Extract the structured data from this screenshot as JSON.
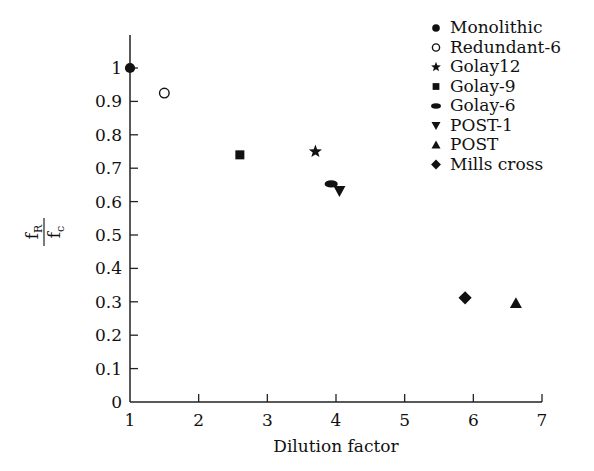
{
  "chart_data": {
    "type": "scatter",
    "title": "",
    "xlabel": "Dilution factor",
    "ylabel": "f_R / f_c",
    "ylabel_parts": {
      "numerator": "f",
      "numerator_sub": "R",
      "denominator": "f",
      "denominator_sub": "c"
    },
    "xlim": [
      1,
      7
    ],
    "ylim": [
      0,
      1
    ],
    "x_ticks": [
      "1",
      "2",
      "3",
      "4",
      "5",
      "6",
      "7"
    ],
    "y_ticks": [
      "0",
      "0.1",
      "0.2",
      "0.3",
      "0.4",
      "0.5",
      "0.6",
      "0.7",
      "0.8",
      "0.9",
      "1"
    ],
    "grid": false,
    "legend_position": "upper right",
    "series": [
      {
        "name": "Monolithic",
        "marker": "filled-circle",
        "x": 1.0,
        "y": 1.0
      },
      {
        "name": "Redundant-6",
        "marker": "open-circle",
        "x": 1.5,
        "y": 0.925
      },
      {
        "name": "Golay12",
        "marker": "star",
        "x": 3.7,
        "y": 0.75
      },
      {
        "name": "Golay-9",
        "marker": "square",
        "x": 2.6,
        "y": 0.74
      },
      {
        "name": "Golay-6",
        "marker": "ellipse",
        "x": 3.93,
        "y": 0.653
      },
      {
        "name": "POST-1",
        "marker": "triangle-down",
        "x": 4.05,
        "y": 0.632
      },
      {
        "name": "POST",
        "marker": "triangle-up",
        "x": 6.62,
        "y": 0.296
      },
      {
        "name": "Mills cross",
        "marker": "diamond",
        "x": 5.88,
        "y": 0.312
      }
    ]
  }
}
